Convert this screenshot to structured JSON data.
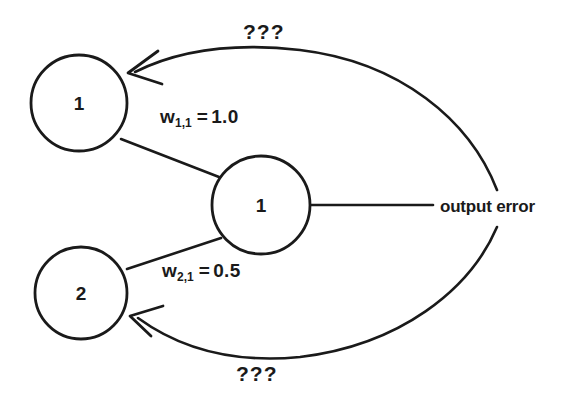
{
  "diagram": {
    "background_color": "#ffffff",
    "stroke_color": "#1a1a1a",
    "nodes": [
      {
        "id": "output-node-1",
        "label": "1",
        "cx": 79,
        "cy": 103,
        "r": 48
      },
      {
        "id": "output-node-2",
        "label": "2",
        "cx": 81,
        "cy": 293,
        "r": 46
      },
      {
        "id": "hidden-node-1",
        "label": "1",
        "cx": 261,
        "cy": 205,
        "r": 49
      }
    ],
    "weights": [
      {
        "id": "weight-1-1",
        "symbol": "w",
        "subscript": "1,1",
        "equals": "=",
        "value": "1.0",
        "x": 160,
        "y": 106
      },
      {
        "id": "weight-2-1",
        "symbol": "w",
        "subscript": "2,1",
        "equals": "=",
        "value": "0.5",
        "x": 162,
        "y": 260
      }
    ],
    "error_label": {
      "text": "output error",
      "x": 440,
      "y": 197
    },
    "unknown_labels": [
      {
        "id": "unknown-top",
        "text": "???",
        "x": 243,
        "y": 20
      },
      {
        "id": "unknown-bottom",
        "text": "???",
        "x": 236,
        "y": 362
      }
    ]
  }
}
